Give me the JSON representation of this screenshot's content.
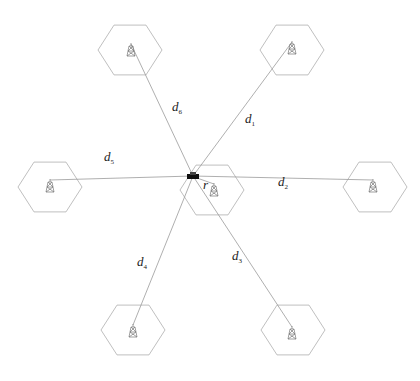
{
  "diagram": {
    "type": "cellular-network-layout",
    "vehicle": {
      "x": 193,
      "y": 176
    },
    "hex_radius": 32,
    "cells": [
      {
        "id": "center",
        "cx": 212,
        "cy": 190,
        "tower": {
          "x": 214,
          "y": 190
        }
      },
      {
        "id": "c1",
        "cx": 292,
        "cy": 50,
        "tower": {
          "x": 292,
          "y": 48
        }
      },
      {
        "id": "c2",
        "cx": 375,
        "cy": 187,
        "tower": {
          "x": 373,
          "y": 186
        }
      },
      {
        "id": "c3",
        "cx": 293,
        "cy": 330,
        "tower": {
          "x": 292,
          "y": 333
        }
      },
      {
        "id": "c4",
        "cx": 133,
        "cy": 330,
        "tower": {
          "x": 133,
          "y": 331
        }
      },
      {
        "id": "c5",
        "cx": 50,
        "cy": 187,
        "tower": {
          "x": 50,
          "y": 186
        }
      },
      {
        "id": "c6",
        "cx": 130,
        "cy": 50,
        "tower": {
          "x": 131,
          "y": 50
        }
      }
    ],
    "labels": [
      {
        "id": "d1",
        "base": "d",
        "sub": "1",
        "x": 245,
        "y": 112
      },
      {
        "id": "d2",
        "base": "d",
        "sub": "2",
        "x": 278,
        "y": 175
      },
      {
        "id": "d3",
        "base": "d",
        "sub": "3",
        "x": 232,
        "y": 249
      },
      {
        "id": "d4",
        "base": "d",
        "sub": "4",
        "x": 137,
        "y": 255
      },
      {
        "id": "d5",
        "base": "d",
        "sub": "5",
        "x": 104,
        "y": 150
      },
      {
        "id": "d6",
        "base": "d",
        "sub": "6",
        "x": 172,
        "y": 100
      },
      {
        "id": "r",
        "base": "r",
        "sub": "",
        "x": 203,
        "y": 178
      }
    ],
    "colors": {
      "hex": "#b8b8b8",
      "link": "#9a9a9a",
      "vehicle": "#111111"
    }
  }
}
